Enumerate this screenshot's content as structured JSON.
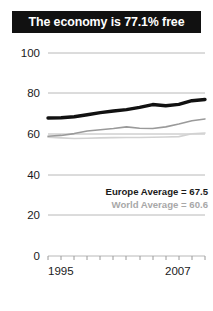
{
  "title": {
    "text": "The economy is 77.1% free"
  },
  "legend": {
    "europe_label": "Europe Average = 67.5",
    "world_label": "World Average = 60.6"
  },
  "axis": {
    "y_ticks": [
      "100",
      "80",
      "60",
      "40",
      "20",
      "0"
    ],
    "x_start_label": "1995",
    "x_end_label": "2007"
  },
  "colors": {
    "title_bg": "#111111",
    "title_fg": "#ffffff",
    "country_line": "#111111",
    "europe_line": "#9a9a9a",
    "world_line": "#d2d2d2",
    "gridline": "#b8b8b8",
    "text": "#1a1a1a"
  },
  "chart_data": {
    "type": "line",
    "title": "The economy is 77.1% free",
    "xlabel": "",
    "ylabel": "",
    "xlim": [
      1995,
      2007
    ],
    "ylim": [
      0,
      100
    ],
    "grid": true,
    "legend_position": "inside-right",
    "x": [
      1995,
      1996,
      1997,
      1998,
      1999,
      2000,
      2001,
      2002,
      2003,
      2004,
      2005,
      2006,
      2007
    ],
    "series": [
      {
        "name": "Country",
        "color": "#111111",
        "style": "thick-solid",
        "values": [
          68.0,
          68.1,
          68.6,
          69.6,
          70.6,
          71.4,
          72.1,
          73.2,
          74.6,
          74.0,
          74.7,
          76.5,
          77.1
        ]
      },
      {
        "name": "Europe Average",
        "color": "#9a9a9a",
        "style": "thin-solid",
        "final_value": 67.5,
        "values": [
          59.0,
          59.4,
          60.3,
          61.6,
          62.2,
          62.8,
          63.6,
          62.9,
          62.8,
          63.6,
          65.0,
          66.6,
          67.5
        ]
      },
      {
        "name": "World Average",
        "color": "#d2d2d2",
        "style": "thin-solid",
        "final_value": 60.6,
        "values": [
          58.5,
          58.2,
          57.9,
          58.0,
          58.2,
          58.3,
          58.4,
          58.4,
          58.5,
          58.6,
          58.8,
          60.2,
          60.6
        ]
      }
    ],
    "annotations": [
      "Europe Average = 67.5",
      "World Average = 60.6"
    ]
  }
}
